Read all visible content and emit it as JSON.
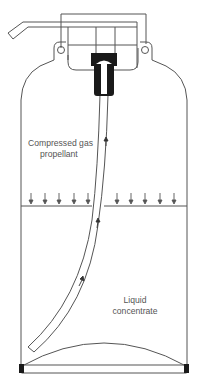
{
  "diagram": {
    "labels": {
      "gas_line1": "Compressed gas",
      "gas_line2": "propellant",
      "liquid_line1": "Liquid",
      "liquid_line2": "concentrate"
    },
    "colors": {
      "stroke": "#555555",
      "fill_dark": "#1a1a1a",
      "background": "#ffffff"
    },
    "pressure_arrows_count": 10,
    "flow_arrows_count": 3
  }
}
